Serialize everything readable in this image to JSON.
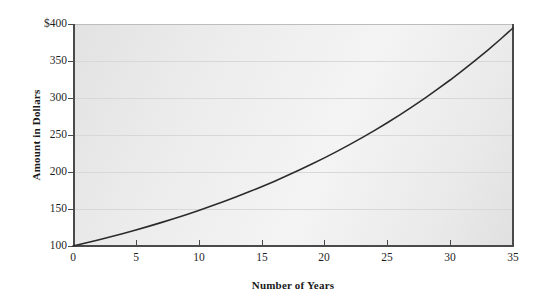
{
  "chart_data": {
    "type": "line",
    "title": "",
    "xlabel": "Number of Years",
    "ylabel": "Amount in Dollars",
    "xlim": [
      0,
      35
    ],
    "ylim": [
      100,
      400
    ],
    "grid": true,
    "legend": "none",
    "x_ticks": [
      "0",
      "5",
      "10",
      "15",
      "20",
      "25",
      "30",
      "35"
    ],
    "x_tick_values": [
      0,
      5,
      10,
      15,
      20,
      25,
      30,
      35
    ],
    "y_ticks": [
      "100",
      "150",
      "200",
      "250",
      "300",
      "350",
      "$400"
    ],
    "y_tick_values": [
      100,
      150,
      200,
      250,
      300,
      350,
      400
    ],
    "line_color": "#2b2b2b",
    "plot_background": "#ececec",
    "series": [
      {
        "name": "Compound growth",
        "x": [
          0,
          1,
          2,
          3,
          4,
          5,
          6,
          7,
          8,
          9,
          10,
          11,
          12,
          13,
          14,
          15,
          16,
          17,
          18,
          19,
          20,
          21,
          22,
          23,
          24,
          25,
          26,
          27,
          28,
          29,
          30,
          31,
          32,
          33,
          34,
          35
        ],
        "values": [
          100,
          104,
          108.2,
          112.5,
          117,
          121.7,
          126.5,
          131.6,
          136.9,
          142.3,
          148,
          153.9,
          160.1,
          166.5,
          173.2,
          180.1,
          187.3,
          194.8,
          202.6,
          210.7,
          219.1,
          227.9,
          237,
          246.5,
          256.3,
          266.6,
          277.2,
          288.3,
          299.9,
          311.9,
          324.3,
          337.3,
          350.8,
          364.8,
          379.4,
          394.6
        ]
      }
    ]
  },
  "axes": {
    "y_title": "Amount in Dollars",
    "x_title": "Number of Years"
  }
}
